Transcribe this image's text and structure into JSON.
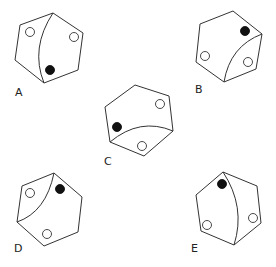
{
  "figures": [
    {
      "label": "A",
      "label_pos": [
        15,
        96
      ],
      "hexagon": [
        [
          53,
          13
        ],
        [
          83,
          33
        ],
        [
          78,
          70
        ],
        [
          44,
          83
        ],
        [
          15,
          60
        ],
        [
          20,
          25
        ]
      ],
      "curve": {
        "from": [
          53,
          13
        ],
        "control": [
          30,
          48
        ],
        "to": [
          44,
          83
        ]
      },
      "open_circles": [
        [
          30,
          32
        ],
        [
          74,
          37
        ]
      ],
      "filled_circles": [
        [
          50,
          70
        ]
      ]
    },
    {
      "label": "B",
      "label_pos": [
        195,
        93
      ],
      "hexagon": [
        [
          233,
          11
        ],
        [
          262,
          34
        ],
        [
          256,
          69
        ],
        [
          224,
          82
        ],
        [
          196,
          62
        ],
        [
          200,
          24
        ]
      ],
      "curve": {
        "from": [
          262,
          34
        ],
        "control": [
          230,
          46
        ],
        "to": [
          224,
          82
        ]
      },
      "open_circles": [
        [
          205,
          56
        ],
        [
          248,
          62
        ]
      ],
      "filled_circles": [
        [
          245,
          31
        ]
      ]
    },
    {
      "label": "C",
      "label_pos": [
        104,
        165
      ],
      "hexagon": [
        [
          135,
          85
        ],
        [
          169,
          96
        ],
        [
          173,
          131
        ],
        [
          144,
          156
        ],
        [
          110,
          142
        ],
        [
          105,
          107
        ]
      ],
      "curve": {
        "from": [
          110,
          142
        ],
        "control": [
          140,
          117
        ],
        "to": [
          173,
          131
        ]
      },
      "open_circles": [
        [
          160,
          104
        ],
        [
          142,
          146
        ]
      ],
      "filled_circles": [
        [
          117,
          127
        ]
      ]
    },
    {
      "label": "D",
      "label_pos": [
        14,
        252
      ],
      "hexagon": [
        [
          54,
          173
        ],
        [
          82,
          197
        ],
        [
          78,
          232
        ],
        [
          44,
          246
        ],
        [
          17,
          222
        ],
        [
          22,
          186
        ]
      ],
      "curve": {
        "from": [
          54,
          173
        ],
        "control": [
          46,
          212
        ],
        "to": [
          17,
          222
        ]
      },
      "open_circles": [
        [
          30,
          193
        ],
        [
          47,
          234
        ]
      ],
      "filled_circles": [
        [
          60,
          189
        ]
      ]
    },
    {
      "label": "E",
      "label_pos": [
        191,
        252
      ],
      "hexagon": [
        [
          223,
          172
        ],
        [
          257,
          186
        ],
        [
          261,
          223
        ],
        [
          234,
          245
        ],
        [
          201,
          231
        ],
        [
          196,
          195
        ]
      ],
      "curve": {
        "from": [
          223,
          172
        ],
        "control": [
          246,
          207
        ],
        "to": [
          234,
          245
        ]
      },
      "open_circles": [
        [
          207,
          225
        ],
        [
          253,
          218
        ]
      ],
      "filled_circles": [
        [
          222,
          184
        ]
      ]
    }
  ],
  "circle_radius": 4.5,
  "colors": {
    "stroke": "#333333",
    "filled": "#111111",
    "background": "#ffffff"
  }
}
